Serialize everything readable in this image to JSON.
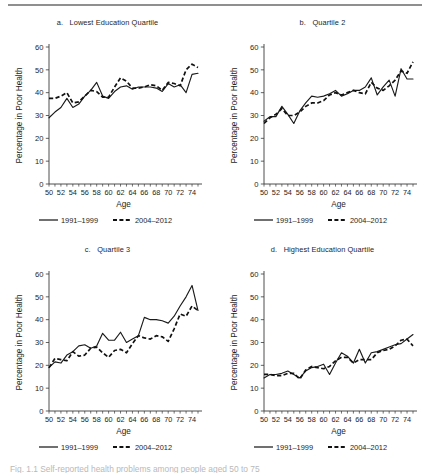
{
  "figure": {
    "caption": "Fig. 1.1 Self-reported health problems among people aged 50 to 75",
    "axis_x_title": "Age",
    "axis_y_title": "Percentage in Poor Health",
    "legend": [
      {
        "label": "1991–1999",
        "style": "solid"
      },
      {
        "label": "2004–2012",
        "style": "dashed"
      }
    ]
  },
  "chart_data": [
    {
      "type": "line",
      "panel": "a",
      "title": "a.   Lowest Education Quartile",
      "xlabel": "Age",
      "ylabel": "Percentage in Poor Health",
      "xlim": [
        50,
        75
      ],
      "ylim": [
        0,
        60
      ],
      "yticks": [
        0,
        10,
        20,
        30,
        40,
        50,
        60
      ],
      "xticks": [
        50,
        52,
        54,
        56,
        58,
        60,
        62,
        64,
        66,
        68,
        70,
        72,
        74
      ],
      "x": [
        50,
        51,
        52,
        53,
        54,
        55,
        56,
        57,
        58,
        59,
        60,
        61,
        62,
        63,
        64,
        65,
        66,
        67,
        68,
        69,
        70,
        71,
        72,
        73,
        74,
        75
      ],
      "series": [
        {
          "name": "1991–1999",
          "style": "solid",
          "values": [
            29.0,
            31.5,
            33.5,
            37.5,
            33.5,
            35.0,
            38.5,
            41.0,
            44.5,
            38.5,
            37.5,
            40.5,
            42.5,
            43.0,
            41.5,
            42.5,
            42.5,
            42.5,
            42.0,
            40.5,
            44.0,
            42.5,
            43.5,
            40.0,
            48.0,
            48.5
          ]
        },
        {
          "name": "2004–2012",
          "style": "dashed",
          "values": [
            37.5,
            37.5,
            38.5,
            40.0,
            35.5,
            36.0,
            38.5,
            41.0,
            40.5,
            38.0,
            38.0,
            42.5,
            46.5,
            45.0,
            42.0,
            42.0,
            42.5,
            43.5,
            43.0,
            41.0,
            44.5,
            44.0,
            43.0,
            50.0,
            52.5,
            51.0
          ]
        }
      ]
    },
    {
      "type": "line",
      "panel": "b",
      "title": "b.   Quartile 2",
      "xlabel": "Age",
      "ylabel": "Percentage in Poor Health",
      "xlim": [
        50,
        75
      ],
      "ylim": [
        0,
        60
      ],
      "yticks": [
        0,
        10,
        20,
        30,
        40,
        50,
        60
      ],
      "xticks": [
        50,
        52,
        54,
        56,
        58,
        60,
        62,
        64,
        66,
        68,
        70,
        72,
        74
      ],
      "x": [
        50,
        51,
        52,
        53,
        54,
        55,
        56,
        57,
        58,
        59,
        60,
        61,
        62,
        63,
        64,
        65,
        66,
        67,
        68,
        69,
        70,
        71,
        72,
        73,
        74,
        75
      ],
      "series": [
        {
          "name": "1991–1999",
          "style": "solid",
          "values": [
            27.5,
            29.5,
            29.5,
            34.0,
            30.5,
            26.5,
            32.0,
            35.5,
            38.5,
            38.0,
            38.5,
            39.5,
            41.0,
            38.5,
            39.5,
            41.0,
            41.0,
            42.5,
            46.5,
            39.0,
            42.5,
            45.5,
            38.5,
            50.5,
            46.0,
            46.0
          ]
        },
        {
          "name": "2004–2012",
          "style": "dashed",
          "values": [
            26.5,
            29.0,
            30.5,
            33.0,
            30.0,
            30.0,
            31.5,
            34.0,
            35.5,
            35.5,
            36.5,
            39.0,
            40.0,
            39.0,
            40.0,
            41.0,
            40.0,
            39.5,
            44.5,
            42.0,
            41.0,
            43.0,
            45.5,
            49.5,
            48.5,
            53.5
          ]
        }
      ]
    },
    {
      "type": "line",
      "panel": "c",
      "title": "c.   Quartile 3",
      "xlabel": "Age",
      "ylabel": "Percentage in Poor Health",
      "xlim": [
        50,
        75
      ],
      "ylim": [
        0,
        60
      ],
      "yticks": [
        0,
        10,
        20,
        30,
        40,
        50,
        60
      ],
      "xticks": [
        50,
        52,
        54,
        56,
        58,
        60,
        62,
        64,
        66,
        68,
        70,
        72,
        74
      ],
      "x": [
        50,
        51,
        52,
        53,
        54,
        55,
        56,
        57,
        58,
        59,
        60,
        61,
        62,
        63,
        64,
        65,
        66,
        67,
        68,
        69,
        70,
        71,
        72,
        73,
        74,
        75
      ],
      "series": [
        {
          "name": "1991–1999",
          "style": "solid",
          "values": [
            19.0,
            21.5,
            21.0,
            24.5,
            26.0,
            28.5,
            29.0,
            27.5,
            28.5,
            34.0,
            31.0,
            31.0,
            34.5,
            30.0,
            31.5,
            33.0,
            41.0,
            40.0,
            40.0,
            39.5,
            38.5,
            41.5,
            46.0,
            50.0,
            55.0,
            44.0
          ]
        },
        {
          "name": "2004–2012",
          "style": "dashed",
          "values": [
            19.0,
            23.0,
            22.5,
            22.0,
            26.0,
            24.0,
            24.5,
            27.5,
            28.0,
            25.5,
            23.5,
            26.5,
            27.0,
            25.5,
            29.5,
            33.0,
            32.0,
            31.5,
            33.0,
            32.5,
            30.5,
            36.0,
            42.5,
            41.5,
            46.0,
            44.0
          ]
        }
      ]
    },
    {
      "type": "line",
      "panel": "d",
      "title": "d.   Highest Education Quartile",
      "xlabel": "Age",
      "ylabel": "Percentage in Poor Health",
      "xlim": [
        50,
        75
      ],
      "ylim": [
        0,
        60
      ],
      "yticks": [
        0,
        10,
        20,
        30,
        40,
        50,
        60
      ],
      "xticks": [
        50,
        52,
        54,
        56,
        58,
        60,
        62,
        64,
        66,
        68,
        70,
        72,
        74
      ],
      "x": [
        50,
        51,
        52,
        53,
        54,
        55,
        56,
        57,
        58,
        59,
        60,
        61,
        62,
        63,
        64,
        65,
        66,
        67,
        68,
        69,
        70,
        71,
        72,
        73,
        74,
        75
      ],
      "series": [
        {
          "name": "1991–1999",
          "style": "solid",
          "values": [
            14.5,
            16.0,
            16.0,
            16.5,
            17.5,
            16.0,
            14.5,
            17.5,
            19.0,
            19.5,
            20.5,
            16.0,
            21.0,
            25.5,
            24.0,
            21.0,
            27.0,
            21.0,
            25.5,
            26.0,
            27.0,
            28.0,
            29.0,
            29.5,
            31.5,
            33.5
          ]
        },
        {
          "name": "2004–2012",
          "style": "dashed",
          "values": [
            16.0,
            16.0,
            15.5,
            15.5,
            16.5,
            16.5,
            14.0,
            18.0,
            19.5,
            19.0,
            18.5,
            19.5,
            22.0,
            23.5,
            23.5,
            21.0,
            22.5,
            22.5,
            22.5,
            25.5,
            26.5,
            27.0,
            28.5,
            31.0,
            31.5,
            28.5
          ]
        }
      ]
    }
  ]
}
